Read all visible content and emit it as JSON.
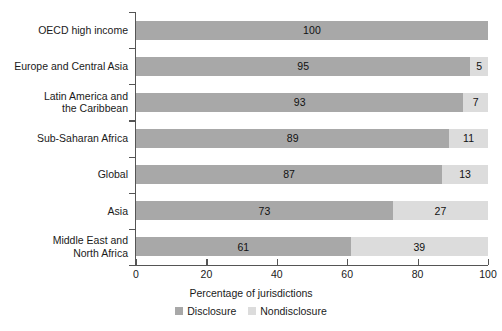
{
  "chart_data": {
    "type": "bar",
    "subtype": "stacked-horizontal-100",
    "title": "",
    "xlabel": "Percentage of jurisdictions",
    "ylabel": "",
    "xlim": [
      0,
      100
    ],
    "xticks": [
      0,
      20,
      40,
      60,
      80,
      100
    ],
    "xtick_labels": [
      "0",
      "20",
      "40",
      "60",
      "80",
      "100"
    ],
    "grid": false,
    "legend_position": "bottom-center",
    "categories": [
      "OECD high income",
      "Europe and Central Asia",
      "Latin America and\nthe Caribbean",
      "Sub-Saharan Africa",
      "Global",
      "Asia",
      "Middle East and\nNorth Africa"
    ],
    "series": [
      {
        "name": "Disclosure",
        "color": "#a8a8a8",
        "values": [
          100,
          95,
          93,
          89,
          87,
          73,
          61
        ]
      },
      {
        "name": "Nondisclosure",
        "color": "#dcdcdc",
        "values": [
          0,
          5,
          7,
          11,
          13,
          27,
          39
        ]
      }
    ],
    "rows": [
      {
        "category": "OECD high income",
        "category_lines": [
          "OECD high income"
        ],
        "disclosure": 100,
        "nondisclosure": 0,
        "disclosure_label": "100",
        "nondisclosure_label": ""
      },
      {
        "category": "Europe and Central Asia",
        "category_lines": [
          "Europe and Central Asia"
        ],
        "disclosure": 95,
        "nondisclosure": 5,
        "disclosure_label": "95",
        "nondisclosure_label": "5"
      },
      {
        "category": "Latin America and the Caribbean",
        "category_lines": [
          "Latin America and",
          "the Caribbean"
        ],
        "disclosure": 93,
        "nondisclosure": 7,
        "disclosure_label": "93",
        "nondisclosure_label": "7"
      },
      {
        "category": "Sub-Saharan Africa",
        "category_lines": [
          "Sub-Saharan Africa"
        ],
        "disclosure": 89,
        "nondisclosure": 11,
        "disclosure_label": "89",
        "nondisclosure_label": "11"
      },
      {
        "category": "Global",
        "category_lines": [
          "Global"
        ],
        "disclosure": 87,
        "nondisclosure": 13,
        "disclosure_label": "87",
        "nondisclosure_label": "13"
      },
      {
        "category": "Asia",
        "category_lines": [
          "Asia"
        ],
        "disclosure": 73,
        "nondisclosure": 27,
        "disclosure_label": "73",
        "nondisclosure_label": "27"
      },
      {
        "category": "Middle East and North Africa",
        "category_lines": [
          "Middle East and",
          "North Africa"
        ],
        "disclosure": 61,
        "nondisclosure": 39,
        "disclosure_label": "61",
        "nondisclosure_label": "39"
      }
    ],
    "legend": [
      {
        "label": "Disclosure",
        "color": "#a8a8a8"
      },
      {
        "label": "Nondisclosure",
        "color": "#dcdcdc"
      }
    ]
  }
}
